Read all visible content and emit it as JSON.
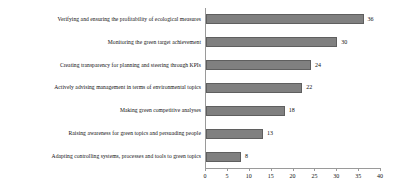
{
  "chart_data": {
    "type": "bar",
    "orientation": "horizontal",
    "title": "",
    "subtitle": "",
    "xlabel": "",
    "ylabel": "",
    "xlim": [
      0,
      40
    ],
    "xticks": [
      0,
      5,
      10,
      15,
      20,
      25,
      30,
      35,
      40
    ],
    "grid": false,
    "legend": false,
    "bar_color": "#808080",
    "bar_border_color": "#5f5f5f",
    "axis_color": "#9a9a9a",
    "text_color": "#101010",
    "categories": [
      "Verifying and ensuring the profitability of ecological measures",
      "Monitoring the green target achievement",
      "Creating transparency for planning and steering through KPIs",
      "Actively advising management in terms of environmental topics",
      "Making green competitive analyses",
      "Raising awareness for green topics and persuading people",
      "Adapting controlling systems, processes and tools to green topics"
    ],
    "values": [
      36,
      30,
      24,
      22,
      18,
      13,
      8
    ],
    "value_labels": [
      "36",
      "30",
      "24",
      "22",
      "18",
      "13",
      "8"
    ]
  }
}
